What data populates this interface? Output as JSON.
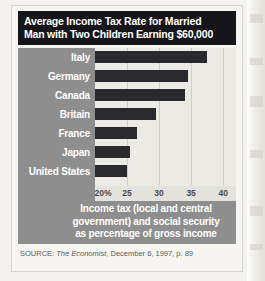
{
  "figure": {
    "title_lines": [
      "Average Income Tax Rate for Married",
      "Man with Two Children Earning $60,000"
    ],
    "caption_lines": [
      "Income tax (local and central",
      "government) and social security",
      "as percentage of gross income"
    ],
    "source": {
      "prefix": "SOURCE:",
      "publication": "The Economist",
      "rest": ", December 6, 1997, p. 89"
    },
    "colors": {
      "title_band": "#15151a",
      "title_text": "#ffffff",
      "panel": "#8e8e8e",
      "plot_background": "#eceae5",
      "bar": "#2a2a2e",
      "gridline": "#cfcdc7",
      "axis_strip": "#e4e2dd",
      "tick_text": "#4a4a4a"
    }
  },
  "chart_data": {
    "type": "bar",
    "orientation": "horizontal",
    "title": "Average Income Tax Rate for Married Man with Two Children Earning $60,000",
    "subtitle": "Income tax (local and central government) and social security as percentage of gross income",
    "xlabel": "",
    "ylabel": "",
    "categories": [
      "Italy",
      "Germany",
      "Canada",
      "Britain",
      "France",
      "Japan",
      "United States"
    ],
    "values": [
      37.5,
      34.5,
      34.0,
      29.5,
      26.5,
      25.5,
      25.0
    ],
    "units": "percent",
    "xlim": [
      20,
      42
    ],
    "xticks": [
      20,
      25,
      30,
      35,
      40
    ],
    "xtick_labels": [
      "20%",
      "25",
      "30",
      "35",
      "40"
    ],
    "grid": true,
    "legend": false,
    "source": "SOURCE: The Economist, December 6, 1997, p. 89"
  }
}
